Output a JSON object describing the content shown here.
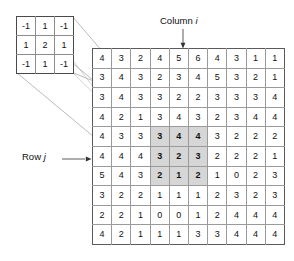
{
  "figure": {
    "type": "convolution-kernel-diagram",
    "colors": {
      "highlight": "#d6d6d6",
      "grid_line": "#9a9a9a",
      "border": "#5a5a5a",
      "connector": "#9a9a9a",
      "text": "#111111",
      "background": "#ffffff"
    }
  },
  "kernel": {
    "name": "kernel-matrix",
    "rows": 3,
    "cols": 3,
    "values": [
      [
        "-1",
        "1",
        "-1"
      ],
      [
        "1",
        "2",
        "1"
      ],
      [
        "-1",
        "1",
        "-1"
      ]
    ]
  },
  "grid": {
    "name": "pixel-grid",
    "rows": 10,
    "cols": 10,
    "values": [
      [
        "4",
        "3",
        "2",
        "4",
        "5",
        "6",
        "4",
        "3",
        "1",
        "1"
      ],
      [
        "3",
        "4",
        "3",
        "2",
        "3",
        "4",
        "5",
        "3",
        "2",
        "1"
      ],
      [
        "3",
        "4",
        "3",
        "3",
        "2",
        "2",
        "3",
        "3",
        "3",
        "4"
      ],
      [
        "4",
        "2",
        "1",
        "3",
        "4",
        "3",
        "2",
        "3",
        "4",
        "4"
      ],
      [
        "4",
        "3",
        "3",
        "3",
        "4",
        "4",
        "3",
        "2",
        "2",
        "2"
      ],
      [
        "4",
        "4",
        "4",
        "3",
        "2",
        "3",
        "2",
        "2",
        "2",
        "1"
      ],
      [
        "5",
        "4",
        "3",
        "2",
        "1",
        "2",
        "1",
        "0",
        "2",
        "3"
      ],
      [
        "3",
        "2",
        "2",
        "1",
        "1",
        "1",
        "2",
        "3",
        "2",
        "3"
      ],
      [
        "2",
        "2",
        "1",
        "0",
        "0",
        "1",
        "2",
        "4",
        "4",
        "4"
      ],
      [
        "4",
        "2",
        "1",
        "1",
        "1",
        "3",
        "3",
        "4",
        "4",
        "4"
      ]
    ],
    "highlight": {
      "row_start": 4,
      "row_end": 6,
      "col_start": 3,
      "col_end": 5,
      "values": [
        [
          "3",
          "4",
          "4"
        ],
        [
          "3",
          "2",
          "3"
        ],
        [
          "2",
          "1",
          "2"
        ]
      ]
    }
  },
  "annotations": {
    "column": {
      "text_prefix": "Column",
      "symbol": "i",
      "points_to_col": 4,
      "arrow": "down-arrow"
    },
    "row": {
      "text_prefix": "Row",
      "symbol": "j",
      "points_to_row": 5,
      "arrow": "right-arrow"
    }
  }
}
